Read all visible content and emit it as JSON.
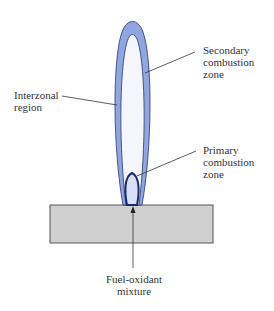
{
  "labels": {
    "secondary": [
      "Secondary",
      "combustion",
      "zone"
    ],
    "interzonal": [
      "Interzonal",
      "region"
    ],
    "primary": [
      "Primary",
      "combustion",
      "zone"
    ],
    "fuel": [
      "Fuel-oxidant",
      "mixture"
    ]
  },
  "colors": {
    "flame_fill": "#8fa6e0",
    "flame_stroke": "#2a3570",
    "inner_fill": "#e6ebf8",
    "primary_stroke": "#1c2a6e",
    "block_fill": "#d0d0d0",
    "block_stroke": "#555555"
  }
}
